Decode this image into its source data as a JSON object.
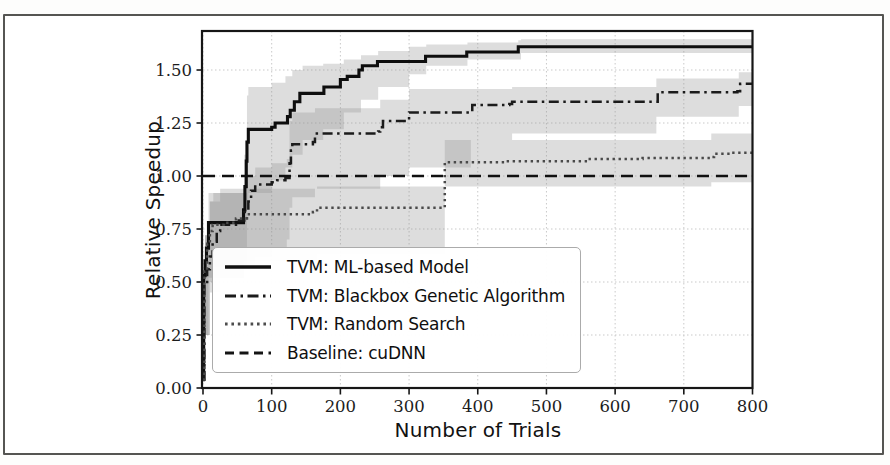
{
  "figure": {
    "background": "#ffffff",
    "frame_color": "#555552",
    "grid_color": "#c9c9c9",
    "spine_color": "#161616",
    "band_color": "#8f8f8f",
    "band_opacity": 0.3,
    "tick_label_color": "#1c1c1c"
  },
  "chart_data": {
    "type": "line",
    "title": "",
    "xlabel": "Number of Trials",
    "ylabel": "Relative Speedup",
    "xlim": [
      0,
      800
    ],
    "ylim": [
      0,
      1.684
    ],
    "xticks": [
      0,
      100,
      200,
      300,
      400,
      500,
      600,
      700,
      800
    ],
    "yticks": [
      0,
      0.25,
      0.5,
      0.75,
      1.0,
      1.25,
      1.5
    ],
    "grid": true,
    "legend_position": "lower left inside",
    "series": [
      {
        "name": "TVM: ML-based Model",
        "style": "solid",
        "color": "#0e0e0e",
        "points": [
          [
            0,
            0.04
          ],
          [
            1,
            0.53
          ],
          [
            3,
            0.6
          ],
          [
            5,
            0.66
          ],
          [
            8,
            0.78
          ],
          [
            55,
            0.78
          ],
          [
            59,
            0.84
          ],
          [
            61,
            0.95
          ],
          [
            63,
            1.07
          ],
          [
            64,
            1.16
          ],
          [
            66,
            1.22
          ],
          [
            100,
            1.23
          ],
          [
            105,
            1.25
          ],
          [
            118,
            1.25
          ],
          [
            123,
            1.28
          ],
          [
            127,
            1.31
          ],
          [
            133,
            1.35
          ],
          [
            141,
            1.39
          ],
          [
            170,
            1.39
          ],
          [
            176,
            1.42
          ],
          [
            200,
            1.455
          ],
          [
            210,
            1.47
          ],
          [
            227,
            1.5
          ],
          [
            232,
            1.52
          ],
          [
            254,
            1.54
          ],
          [
            324,
            1.565
          ],
          [
            384,
            1.585
          ],
          [
            459,
            1.61
          ],
          [
            800,
            1.61
          ]
        ],
        "band": [
          [
            0,
            0.03,
            0.55
          ],
          [
            3,
            0.25,
            0.72
          ],
          [
            8,
            0.52,
            0.92
          ],
          [
            55,
            0.52,
            0.92
          ],
          [
            60,
            0.6,
            1.1
          ],
          [
            64,
            0.85,
            1.38
          ],
          [
            66,
            0.92,
            1.42
          ],
          [
            100,
            0.98,
            1.44
          ],
          [
            120,
            1.04,
            1.47
          ],
          [
            130,
            1.1,
            1.5
          ],
          [
            145,
            1.17,
            1.52
          ],
          [
            175,
            1.22,
            1.53
          ],
          [
            205,
            1.3,
            1.55
          ],
          [
            230,
            1.36,
            1.57
          ],
          [
            255,
            1.42,
            1.59
          ],
          [
            300,
            1.48,
            1.61
          ],
          [
            325,
            1.52,
            1.62
          ],
          [
            385,
            1.55,
            1.63
          ],
          [
            459,
            1.55,
            1.64
          ],
          [
            463,
            1.58,
            1.645
          ],
          [
            800,
            1.58,
            1.645
          ]
        ]
      },
      {
        "name": "TVM: Blackbox Genetic Algorithm",
        "style": "dashdot",
        "color": "#1b1b1b",
        "points": [
          [
            0,
            0.04
          ],
          [
            2,
            0.5
          ],
          [
            6,
            0.56
          ],
          [
            10,
            0.62
          ],
          [
            14,
            0.69
          ],
          [
            20,
            0.74
          ],
          [
            25,
            0.77
          ],
          [
            50,
            0.79
          ],
          [
            60,
            0.83
          ],
          [
            66,
            0.88
          ],
          [
            70,
            0.93
          ],
          [
            76,
            0.96
          ],
          [
            100,
            0.97
          ],
          [
            108,
            0.98
          ],
          [
            120,
            0.99
          ],
          [
            126,
            1.06
          ],
          [
            128,
            1.12
          ],
          [
            130,
            1.15
          ],
          [
            160,
            1.16
          ],
          [
            163,
            1.2
          ],
          [
            255,
            1.21
          ],
          [
            258,
            1.23
          ],
          [
            262,
            1.26
          ],
          [
            296,
            1.26
          ],
          [
            300,
            1.3
          ],
          [
            388,
            1.3
          ],
          [
            392,
            1.335
          ],
          [
            446,
            1.34
          ],
          [
            450,
            1.35
          ],
          [
            658,
            1.35
          ],
          [
            662,
            1.395
          ],
          [
            778,
            1.4
          ],
          [
            782,
            1.435
          ],
          [
            800,
            1.435
          ]
        ],
        "band": [
          [
            0,
            0.03,
            0.55
          ],
          [
            3,
            0.25,
            0.72
          ],
          [
            10,
            0.45,
            0.88
          ],
          [
            25,
            0.52,
            0.94
          ],
          [
            60,
            0.58,
            1.0
          ],
          [
            76,
            0.62,
            1.04
          ],
          [
            100,
            0.66,
            1.06
          ],
          [
            122,
            0.7,
            1.08
          ],
          [
            126,
            0.85,
            1.26
          ],
          [
            130,
            0.9,
            1.3
          ],
          [
            163,
            0.94,
            1.32
          ],
          [
            258,
            1.0,
            1.36
          ],
          [
            300,
            1.04,
            1.41
          ],
          [
            390,
            1.17,
            1.41
          ],
          [
            450,
            1.2,
            1.42
          ],
          [
            660,
            1.28,
            1.46
          ],
          [
            780,
            1.33,
            1.49
          ],
          [
            800,
            1.33,
            1.49
          ]
        ]
      },
      {
        "name": "TVM: Random Search",
        "style": "dotted",
        "color": "#4a4a4a",
        "points": [
          [
            0,
            0.04
          ],
          [
            2,
            0.55
          ],
          [
            6,
            0.68
          ],
          [
            10,
            0.74
          ],
          [
            14,
            0.77
          ],
          [
            30,
            0.78
          ],
          [
            48,
            0.8
          ],
          [
            64,
            0.82
          ],
          [
            160,
            0.83
          ],
          [
            166,
            0.85
          ],
          [
            348,
            0.85
          ],
          [
            352,
            1.065
          ],
          [
            440,
            1.07
          ],
          [
            560,
            1.08
          ],
          [
            640,
            1.085
          ],
          [
            738,
            1.09
          ],
          [
            744,
            1.105
          ],
          [
            770,
            1.11
          ],
          [
            800,
            1.11
          ]
        ],
        "band": [
          [
            0,
            0.03,
            0.55
          ],
          [
            3,
            0.25,
            0.72
          ],
          [
            10,
            0.5,
            0.88
          ],
          [
            15,
            0.57,
            0.92
          ],
          [
            64,
            0.6,
            0.94
          ],
          [
            166,
            0.63,
            0.95
          ],
          [
            348,
            0.63,
            0.95
          ],
          [
            352,
            0.95,
            1.17
          ],
          [
            740,
            0.97,
            1.2
          ],
          [
            800,
            0.97,
            1.2
          ]
        ]
      },
      {
        "name": "Baseline: cuDNN",
        "style": "dashed",
        "color": "#101010",
        "points": [
          [
            0,
            1.0
          ],
          [
            800,
            1.0
          ]
        ],
        "band": []
      }
    ]
  }
}
